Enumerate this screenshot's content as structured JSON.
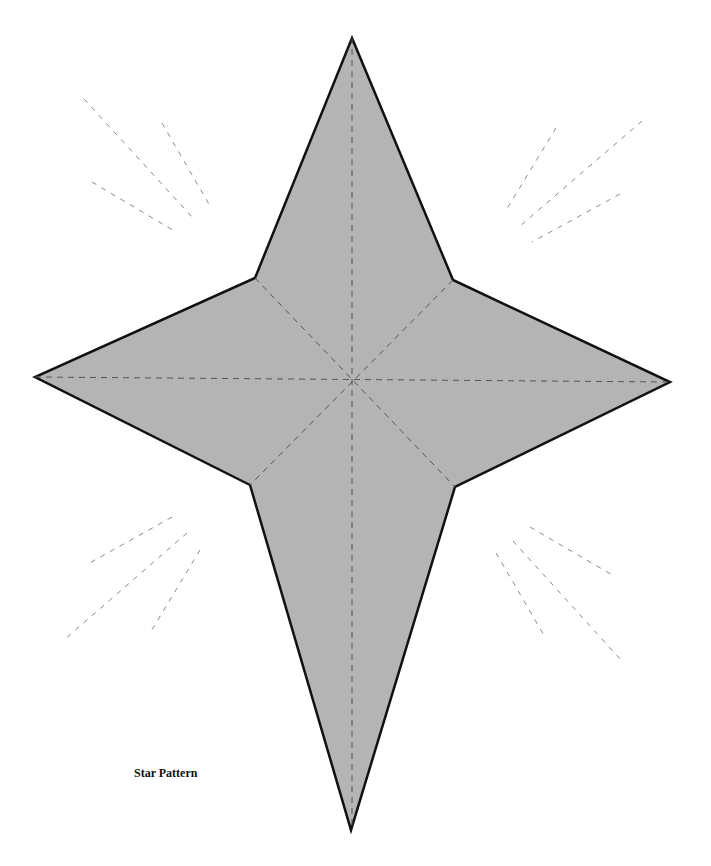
{
  "diagram": {
    "title": "Star Pattern",
    "colors": {
      "background": "#ffffff",
      "star_fill": "#b4b4b4",
      "star_outline": "#111111",
      "fold_line": "#555555",
      "ray_line": "#8a8a8a"
    },
    "star": {
      "points": [
        [
          352,
          38
        ],
        [
          453,
          280
        ],
        [
          670,
          382
        ],
        [
          455,
          487
        ],
        [
          351,
          830
        ],
        [
          250,
          485
        ],
        [
          35,
          377
        ],
        [
          255,
          278
        ]
      ]
    },
    "fold_lines": [
      [
        [
          352,
          38
        ],
        [
          352,
          830
        ]
      ],
      [
        [
          35,
          377
        ],
        [
          670,
          382
        ]
      ],
      [
        [
          255,
          278
        ],
        [
          455,
          487
        ]
      ],
      [
        [
          453,
          280
        ],
        [
          250,
          485
        ]
      ]
    ],
    "rays": [
      [
        [
          84,
          99
        ],
        [
          192,
          217
        ]
      ],
      [
        [
          162,
          123
        ],
        [
          210,
          206
        ]
      ],
      [
        [
          92,
          182
        ],
        [
          176,
          232
        ]
      ],
      [
        [
          556,
          128
        ],
        [
          505,
          212
        ]
      ],
      [
        [
          642,
          121
        ],
        [
          520,
          226
        ]
      ],
      [
        [
          620,
          194
        ],
        [
          532,
          242
        ]
      ],
      [
        [
          172,
          517
        ],
        [
          86,
          565
        ]
      ],
      [
        [
          187,
          533
        ],
        [
          64,
          640
        ]
      ],
      [
        [
          200,
          550
        ],
        [
          150,
          633
        ]
      ],
      [
        [
          530,
          527
        ],
        [
          614,
          576
        ]
      ],
      [
        [
          513,
          541
        ],
        [
          621,
          660
        ]
      ],
      [
        [
          496,
          553
        ],
        [
          545,
          637
        ]
      ]
    ]
  }
}
